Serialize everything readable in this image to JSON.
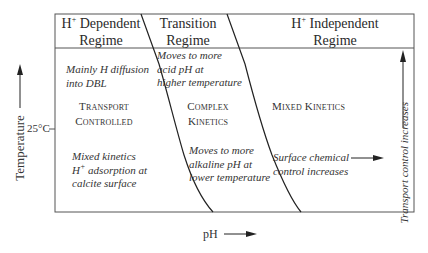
{
  "diagram": {
    "regimes": [
      {
        "title_sup": "H",
        "title_sup_mark": "+",
        "title_rest": " Dependent",
        "title_line2": "Regime"
      },
      {
        "title_line1": "Transition",
        "title_line2": "Regime"
      },
      {
        "title_sup": "H",
        "title_sup_mark": "+",
        "title_rest": " Independent",
        "title_line2": "Regime"
      }
    ],
    "dependent": {
      "top_note": [
        "Mainly H diffusion",
        "into DBL"
      ],
      "center_label": [
        "Transport",
        "Controlled"
      ],
      "bottom_note_1": "Mixed kinetics",
      "bottom_note_2_sup_base": "H",
      "bottom_note_2_sup": "+",
      "bottom_note_2_rest": " adsorption at",
      "bottom_note_3": "calcite surface"
    },
    "transition": {
      "top_note": [
        "Moves to more",
        "acid pH at",
        "higher temperature"
      ],
      "center_label": [
        "Complex",
        "Kinetics"
      ],
      "bottom_note": [
        "Moves to more",
        "alkaline pH at",
        "lower temperature"
      ]
    },
    "independent": {
      "center_label": "Mixed Kinetics",
      "bottom_note": [
        "Surface chemical",
        "control increases"
      ]
    },
    "axes": {
      "y_label": "Temperature",
      "y_tick": "25°C",
      "x_label": "pH",
      "right_label": "Transport control increases"
    },
    "colors": {
      "line": "#333333",
      "text": "#333333"
    }
  }
}
